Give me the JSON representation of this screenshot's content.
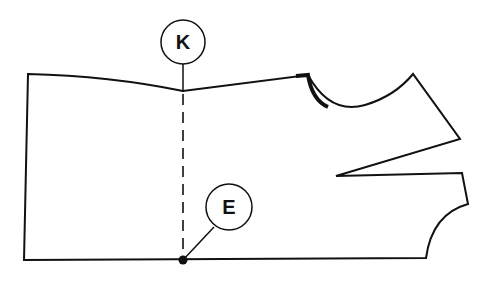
{
  "diagram": {
    "type": "sewing pattern piece",
    "labels": [
      {
        "id": "K",
        "text": "K"
      },
      {
        "id": "E",
        "text": "E"
      }
    ],
    "colors": {
      "line": "#111111",
      "background": "#ffffff"
    }
  }
}
